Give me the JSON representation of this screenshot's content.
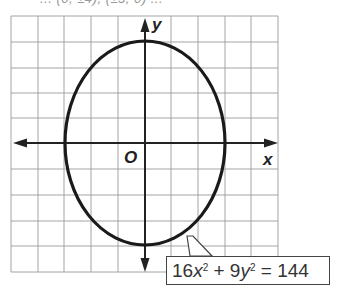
{
  "header": {
    "partial_text": "... (0, ±4), (±3, 0) ..."
  },
  "graph": {
    "x_axis_label": "x",
    "y_axis_label": "y",
    "origin_label": "O",
    "grid": {
      "columns": 10,
      "rows": 10,
      "cell_px": 26.7
    },
    "ellipse": {
      "center": [
        0,
        0
      ],
      "semi_major_y": 4,
      "semi_minor_x": 3
    }
  },
  "equation": {
    "coef_x": "16",
    "var_x": "x",
    "exp_x": "2",
    "plus": " + ",
    "coef_y": "9",
    "var_y": "y",
    "exp_y": "2",
    "equals": " = ",
    "rhs": "144"
  },
  "colors": {
    "grid": "#9a9a9a",
    "axis": "#222222",
    "curve": "#1a1a1a"
  }
}
